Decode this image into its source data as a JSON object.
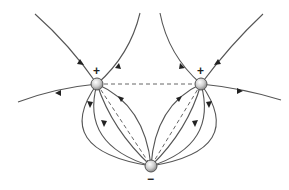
{
  "diagram": {
    "charges": [
      {
        "id": "left-positive",
        "sign": "+",
        "x": 97,
        "y": 84
      },
      {
        "id": "right-positive",
        "sign": "+",
        "x": 201,
        "y": 84
      },
      {
        "id": "bottom-negative",
        "sign": "−",
        "x": 151,
        "y": 166
      }
    ],
    "labels": {
      "left_sign": "+",
      "right_sign": "+",
      "bottom_sign": "−"
    },
    "colors": {
      "line": "#555555",
      "charge_fill": "#c8c8c8",
      "charge_stroke": "#555555"
    }
  }
}
